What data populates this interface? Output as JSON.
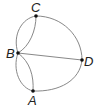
{
  "diagram": {
    "type": "multigraph",
    "nodes": [
      {
        "id": "C",
        "label": "C",
        "x": 36,
        "y": 16
      },
      {
        "id": "B",
        "label": "B",
        "x": 18,
        "y": 53
      },
      {
        "id": "D",
        "label": "D",
        "x": 82,
        "y": 60
      },
      {
        "id": "A",
        "label": "A",
        "x": 33,
        "y": 91
      }
    ],
    "edges": [
      {
        "from": "B",
        "to": "C",
        "shape": "outer-curve"
      },
      {
        "from": "B",
        "to": "C",
        "shape": "inner-curve"
      },
      {
        "from": "B",
        "to": "A",
        "shape": "outer-curve"
      },
      {
        "from": "B",
        "to": "A",
        "shape": "inner-curve"
      },
      {
        "from": "B",
        "to": "D",
        "shape": "straight"
      },
      {
        "from": "C",
        "to": "D",
        "shape": "arc"
      },
      {
        "from": "A",
        "to": "D",
        "shape": "arc"
      }
    ],
    "colors": {
      "edge": "#888888",
      "node": "#111111",
      "label": "#222222"
    }
  }
}
